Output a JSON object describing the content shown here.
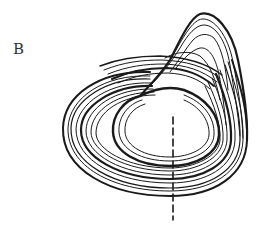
{
  "figure": {
    "panel_label": "B",
    "colors": {
      "ink": "#1a1a1a",
      "background": "#ffffff"
    },
    "elements": {
      "attractor": "spiral-band of nested orbits",
      "fold": "upper lobe where orbits cross and fold back",
      "section_line": "dashed vertical line through the lower band"
    }
  }
}
